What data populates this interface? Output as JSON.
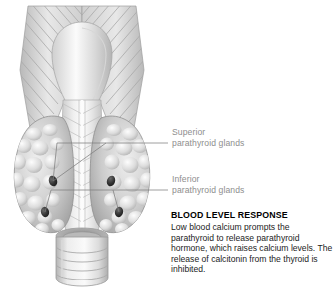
{
  "figure": {
    "background": "#ffffff",
    "palette": {
      "tissue_light": "#f2f2f2",
      "tissue_mid": "#c9c9c9",
      "tissue_dark": "#9a9a9a",
      "outline": "#8a8a8a",
      "gland_dark": "#2e2e2e",
      "leader_line": "#7d7d7d",
      "label_text": "#8e8e8e",
      "body_text": "#1c1c1c",
      "heading_text": "#000000"
    },
    "structures": [
      "larynx",
      "thyroid-cartilage",
      "thyroid-lobe-left",
      "thyroid-lobe-right",
      "isthmus",
      "trachea"
    ]
  },
  "labels": {
    "superior": {
      "line1": "Superior",
      "line2": "parathyroid glands"
    },
    "inferior": {
      "line1": "Inferior",
      "line2": "parathyroid glands"
    }
  },
  "response": {
    "title": "BLOOD LEVEL RESPONSE",
    "body": "Low blood calcium prompts the parathyroid to release parathyroid hormone, which raises calcium levels. The release of calcitonin from the thyroid is inhibited."
  }
}
